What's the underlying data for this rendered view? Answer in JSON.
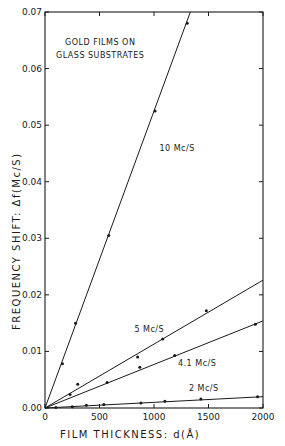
{
  "chart_data": {
    "type": "line",
    "title": "GOLD FILMS ON GLASS SUBSTRATES",
    "title_lines": [
      "GOLD FILMS ON",
      "GLASS SUBSTRATES"
    ],
    "xlabel": "FILM THICKNESS: d(Å)",
    "ylabel": "FREQUENCY SHIFT: Δf(Mc/S)",
    "xlim": [
      0,
      2000
    ],
    "ylim": [
      0,
      0.07
    ],
    "xticks": [
      0,
      500,
      1000,
      1500,
      2000
    ],
    "xtick_labels": [
      "0",
      "500",
      "1000",
      "1500",
      "2000"
    ],
    "yticks": [
      0,
      0.01,
      0.02,
      0.03,
      0.04,
      0.05,
      0.06,
      0.07
    ],
    "ytick_labels": [
      "0.00",
      "0.01",
      "0.02",
      "0.03",
      "0.04",
      "0.05",
      "0.06",
      "0.07"
    ],
    "grid": false,
    "legend": "inline labels",
    "series": [
      {
        "name": "10 Mc/S",
        "label_pos": [
          1050,
          0.0455
        ],
        "fit_slope": 5.25e-05,
        "points": [
          [
            160,
            0.0078
          ],
          [
            280,
            0.015
          ],
          [
            585,
            0.0305
          ],
          [
            1010,
            0.0525
          ],
          [
            1305,
            0.068
          ]
        ]
      },
      {
        "name": "5 Mc/S",
        "label_pos": [
          820,
          0.0135
        ],
        "fit_slope": 1.13e-05,
        "points": [
          [
            300,
            0.0042
          ],
          [
            850,
            0.009
          ],
          [
            1080,
            0.0122
          ],
          [
            1480,
            0.0172
          ]
        ]
      },
      {
        "name": "4.1 Mc/S",
        "label_pos": [
          1220,
          0.0074
        ],
        "fit_slope": 7.7e-06,
        "points": [
          [
            230,
            0.0024
          ],
          [
            570,
            0.0045
          ],
          [
            870,
            0.0072
          ],
          [
            1190,
            0.0093
          ],
          [
            1930,
            0.0148
          ]
        ]
      },
      {
        "name": "2 Mc/S",
        "label_pos": [
          1320,
          0.003
        ],
        "fit_slope": 1e-06,
        "points": [
          [
            100,
            0.0001
          ],
          [
            250,
            0.0002
          ],
          [
            380,
            0.0005
          ],
          [
            540,
            0.0006
          ],
          [
            880,
            0.0009
          ],
          [
            1100,
            0.0012
          ],
          [
            1430,
            0.0016
          ],
          [
            1950,
            0.002
          ]
        ]
      }
    ]
  }
}
